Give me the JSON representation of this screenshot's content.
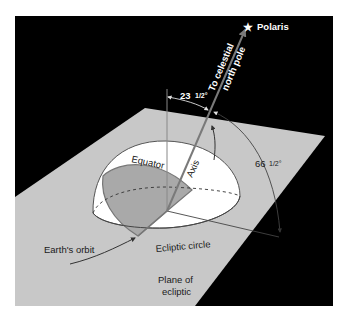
{
  "diagram": {
    "labels": {
      "polaris": "Polaris",
      "to_celestial": "To celestial",
      "north_pole": "north pole",
      "tilt_angle": "23 1/2°",
      "tilt_whole": "23",
      "tilt_frac": "1/2°",
      "complement_angle": "66 1/2°",
      "complement_whole": "66",
      "complement_frac": "1/2°",
      "equator": "Equator",
      "axis": "Axis",
      "ecliptic_circle": "Ecliptic circle",
      "earths_orbit": "Earth's orbit",
      "plane_of": "Plane of",
      "ecliptic": "ecliptic"
    },
    "icons": {
      "star": "★"
    },
    "colors": {
      "background": "#000000",
      "plane": "#c8c8c8",
      "hemisphere": "#ffffff",
      "equator_plane": "#a9a9a9",
      "axis": "#6e6e6e",
      "frame": "#ffffff"
    }
  }
}
